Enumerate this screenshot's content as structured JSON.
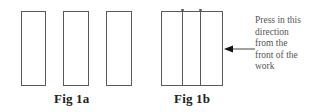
{
  "figures": {
    "fig1a": {
      "label": "Fig 1a",
      "panels": 3
    },
    "fig1b": {
      "label": "Fig 1b",
      "panels": 3
    }
  },
  "annotation": {
    "lines": [
      "Press in this",
      "direction",
      "from the",
      "front of the",
      "work"
    ]
  },
  "colors": {
    "stroke": "#5a5a5a",
    "text": "#222222",
    "note": "#555555"
  }
}
